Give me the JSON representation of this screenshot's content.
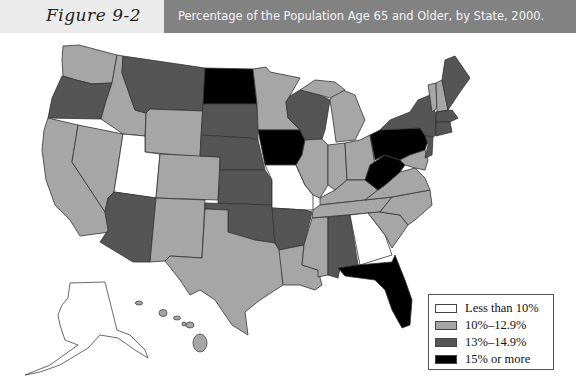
{
  "header": {
    "figure_label": "Figure 9-2",
    "title": "Percentage of the Population Age 65 and Older, by State, 2000."
  },
  "legend": {
    "items": [
      {
        "label": "Less than 10%",
        "color": "#ffffff"
      },
      {
        "label": "10%–12.9%",
        "color": "#a6a6a6"
      },
      {
        "label": "13%–14.9%",
        "color": "#555555"
      },
      {
        "label": "15% or more",
        "color": "#000000"
      }
    ]
  },
  "map_data": {
    "type": "choropleth",
    "region": "United States",
    "year": 2000,
    "metric": "Percentage of population age 65 and older",
    "categories": {
      "Less than 10%": [
        "Alaska",
        "Utah",
        "Georgia",
        "Colorado?"
      ],
      "10%-12.9%": [
        "Washington",
        "Idaho",
        "Wyoming",
        "Colorado",
        "California",
        "Nevada",
        "New Mexico",
        "Texas",
        "Minnesota",
        "Michigan",
        "Illinois",
        "Indiana",
        "Ohio",
        "Kentucky",
        "Tennessee",
        "Mississippi",
        "Louisiana",
        "Virginia",
        "North Carolina",
        "South Carolina",
        "Maryland",
        "Delaware",
        "Vermont",
        "New Hampshire",
        "Hawaii"
      ],
      "13%-14.9%": [
        "Oregon",
        "Montana",
        "South Dakota",
        "Nebraska",
        "Kansas",
        "Oklahoma",
        "Arkansas",
        "Arizona",
        "Wisconsin",
        "Alabama",
        "Missouri?",
        "New York",
        "Maine",
        "Massachusetts",
        "Connecticut",
        "New Jersey",
        "Rhode Island"
      ],
      "15% or more": [
        "North Dakota",
        "Iowa",
        "Pennsylvania",
        "West Virginia",
        "Florida"
      ]
    },
    "notes": "Missouri and Georgia appear white (Less than 10%) in the rendered map; Utah and Alaska also appear white."
  },
  "colors": {
    "white": "#ffffff",
    "light": "#a6a6a6",
    "dark": "#555555",
    "black": "#000000",
    "border": "#333333"
  }
}
